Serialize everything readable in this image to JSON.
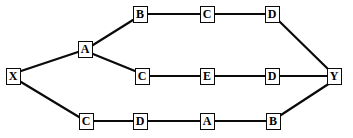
{
  "diagram": {
    "type": "node-link-graph",
    "canvas": {
      "width": 353,
      "height": 138
    },
    "style": {
      "background_color": "#ffffff",
      "node_border_color": "#0a0a0a",
      "node_fill_color": "#ffffff",
      "edge_color": "#0a0a0a",
      "label_color": "#000000"
    },
    "nodes": [
      {
        "id": "X",
        "label": "X",
        "x": 13,
        "y": 76,
        "w": 15,
        "h": 17
      },
      {
        "id": "A1",
        "label": "A",
        "x": 85,
        "y": 49,
        "w": 15,
        "h": 17
      },
      {
        "id": "B1",
        "label": "B",
        "x": 140,
        "y": 14,
        "w": 15,
        "h": 17
      },
      {
        "id": "C1",
        "label": "C",
        "x": 207,
        "y": 14,
        "w": 15,
        "h": 17
      },
      {
        "id": "D1",
        "label": "D",
        "x": 272,
        "y": 14,
        "w": 15,
        "h": 17
      },
      {
        "id": "C2",
        "label": "C",
        "x": 142,
        "y": 76,
        "w": 15,
        "h": 17
      },
      {
        "id": "E2",
        "label": "E",
        "x": 207,
        "y": 76,
        "w": 15,
        "h": 17
      },
      {
        "id": "D2",
        "label": "D",
        "x": 272,
        "y": 76,
        "w": 15,
        "h": 17
      },
      {
        "id": "C3",
        "label": "C",
        "x": 86,
        "y": 121,
        "w": 15,
        "h": 17
      },
      {
        "id": "D3",
        "label": "D",
        "x": 140,
        "y": 121,
        "w": 15,
        "h": 17
      },
      {
        "id": "A3",
        "label": "A",
        "x": 207,
        "y": 121,
        "w": 15,
        "h": 17
      },
      {
        "id": "B3",
        "label": "B",
        "x": 273,
        "y": 121,
        "w": 15,
        "h": 17
      },
      {
        "id": "Y",
        "label": "Y",
        "x": 334,
        "y": 76,
        "w": 15,
        "h": 17
      }
    ],
    "edges": [
      {
        "from": "X",
        "to": "A1",
        "x1": 21,
        "y1": 71,
        "x2": 78,
        "y2": 52
      },
      {
        "from": "X",
        "to": "C3",
        "x1": 21,
        "y1": 82,
        "x2": 79,
        "y2": 117
      },
      {
        "from": "A1",
        "to": "B1",
        "x1": 93,
        "y1": 45,
        "x2": 133,
        "y2": 20
      },
      {
        "from": "A1",
        "to": "C2",
        "x1": 93,
        "y1": 54,
        "x2": 135,
        "y2": 71
      },
      {
        "from": "B1",
        "to": "C1",
        "x1": 148,
        "y1": 14,
        "x2": 200,
        "y2": 14
      },
      {
        "from": "C1",
        "to": "D1",
        "x1": 215,
        "y1": 14,
        "x2": 265,
        "y2": 14
      },
      {
        "from": "D1",
        "to": "Y",
        "x1": 279,
        "y1": 21,
        "x2": 329,
        "y2": 70
      },
      {
        "from": "C2",
        "to": "E2",
        "x1": 150,
        "y1": 76,
        "x2": 200,
        "y2": 76
      },
      {
        "from": "E2",
        "to": "D2",
        "x1": 215,
        "y1": 76,
        "x2": 265,
        "y2": 76
      },
      {
        "from": "D2",
        "to": "Y",
        "x1": 280,
        "y1": 76,
        "x2": 327,
        "y2": 76
      },
      {
        "from": "C3",
        "to": "D3",
        "x1": 94,
        "y1": 121,
        "x2": 133,
        "y2": 121
      },
      {
        "from": "D3",
        "to": "A3",
        "x1": 148,
        "y1": 121,
        "x2": 200,
        "y2": 121
      },
      {
        "from": "A3",
        "to": "B3",
        "x1": 215,
        "y1": 121,
        "x2": 266,
        "y2": 121
      },
      {
        "from": "B3",
        "to": "Y",
        "x1": 281,
        "y1": 115,
        "x2": 330,
        "y2": 83
      }
    ]
  }
}
